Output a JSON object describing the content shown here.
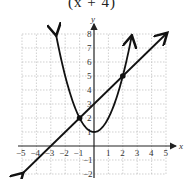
{
  "caption": "(x + 4)",
  "chart_data": {
    "type": "line",
    "title": "",
    "xlabel": "x",
    "ylabel": "y",
    "xlim": [
      -5,
      5
    ],
    "ylim": [
      -2,
      8
    ],
    "grid": true,
    "x_ticks": [
      -5,
      -4,
      -3,
      -2,
      -1,
      1,
      2,
      3,
      4,
      5
    ],
    "y_ticks": [
      -2,
      -1,
      1,
      2,
      3,
      4,
      5,
      6,
      7,
      8
    ],
    "series": [
      {
        "name": "line",
        "equation": "y = x + 3",
        "points": [
          [
            -5,
            -2
          ],
          [
            -3,
            0
          ],
          [
            -1,
            2
          ],
          [
            0,
            3
          ],
          [
            2,
            5
          ],
          [
            5,
            8
          ]
        ]
      },
      {
        "name": "parabola",
        "equation": "y = x^2 + 1",
        "points": [
          [
            -2.65,
            8
          ],
          [
            -2,
            5
          ],
          [
            -1,
            2
          ],
          [
            0,
            1
          ],
          [
            1,
            2
          ],
          [
            2,
            5
          ],
          [
            2.65,
            8
          ]
        ]
      }
    ],
    "intersections": [
      [
        -1,
        2
      ],
      [
        2,
        5
      ]
    ]
  }
}
